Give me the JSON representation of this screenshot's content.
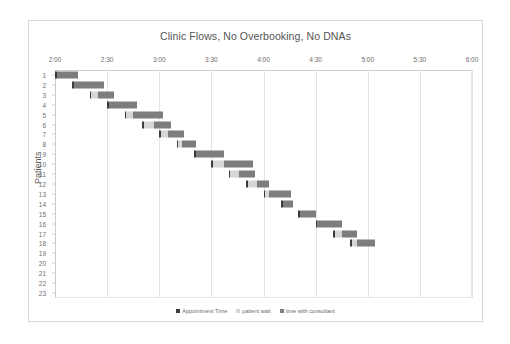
{
  "chart_data": {
    "type": "bar",
    "subtype": "stacked-horizontal-gantt",
    "title": "Clinic Flows, No Overbooking, No DNAs",
    "xlabel": "",
    "ylabel": "Patients",
    "xlim": [
      120,
      360
    ],
    "xtick_labels": [
      "2:00",
      "2:30",
      "3:00",
      "3:30",
      "4:00",
      "4:30",
      "5:00",
      "5:30",
      "6:00"
    ],
    "xtick_values": [
      120,
      150,
      180,
      210,
      240,
      270,
      300,
      330,
      360
    ],
    "categories": [
      "1",
      "2",
      "3",
      "4",
      "5",
      "6",
      "7",
      "8",
      "9",
      "10",
      "11",
      "12",
      "13",
      "14",
      "15",
      "16",
      "17",
      "18",
      "19",
      "20",
      "21",
      "22",
      "23"
    ],
    "ylim": [
      1,
      23
    ],
    "grid": "vertical",
    "legend_position": "bottom",
    "series": [
      {
        "name": "Appointment Time",
        "color": "#3b3b3b",
        "values": [
          120,
          130,
          140,
          150,
          160,
          170,
          180,
          190,
          200,
          210,
          220,
          230,
          240,
          250,
          260,
          270,
          280,
          290,
          null,
          null,
          null,
          null,
          null
        ]
      },
      {
        "name": "patient wait",
        "color": "#d6d6d6",
        "values": [
          0,
          0,
          4,
          0,
          4,
          6,
          4,
          2,
          0,
          6,
          5,
          5,
          2,
          0,
          0,
          0,
          4,
          3,
          null,
          null,
          null,
          null,
          null
        ]
      },
      {
        "name": "time with consultant",
        "color": "#7d7d7d",
        "values": [
          12,
          17,
          9,
          16,
          17,
          10,
          9,
          8,
          16,
          17,
          9,
          7,
          13,
          6,
          9,
          14,
          9,
          10,
          null,
          null,
          null,
          null,
          null
        ]
      }
    ],
    "bars": [
      {
        "patient": "1",
        "appointment_start": 120,
        "wait": 0,
        "consult": 12
      },
      {
        "patient": "2",
        "appointment_start": 130,
        "wait": 0,
        "consult": 17
      },
      {
        "patient": "3",
        "appointment_start": 140,
        "wait": 4,
        "consult": 9
      },
      {
        "patient": "4",
        "appointment_start": 150,
        "wait": 0,
        "consult": 16
      },
      {
        "patient": "5",
        "appointment_start": 160,
        "wait": 4,
        "consult": 17
      },
      {
        "patient": "6",
        "appointment_start": 170,
        "wait": 6,
        "consult": 10
      },
      {
        "patient": "7",
        "appointment_start": 180,
        "wait": 4,
        "consult": 9
      },
      {
        "patient": "8",
        "appointment_start": 190,
        "wait": 2,
        "consult": 8
      },
      {
        "patient": "9",
        "appointment_start": 200,
        "wait": 0,
        "consult": 16
      },
      {
        "patient": "10",
        "appointment_start": 210,
        "wait": 6,
        "consult": 17
      },
      {
        "patient": "11",
        "appointment_start": 220,
        "wait": 5,
        "consult": 9
      },
      {
        "patient": "12",
        "appointment_start": 230,
        "wait": 5,
        "consult": 7
      },
      {
        "patient": "13",
        "appointment_start": 240,
        "wait": 2,
        "consult": 13
      },
      {
        "patient": "14",
        "appointment_start": 250,
        "wait": 0,
        "consult": 6
      },
      {
        "patient": "15",
        "appointment_start": 260,
        "wait": 0,
        "consult": 9
      },
      {
        "patient": "16",
        "appointment_start": 270,
        "wait": 0,
        "consult": 14
      },
      {
        "patient": "17",
        "appointment_start": 280,
        "wait": 4,
        "consult": 9
      },
      {
        "patient": "18",
        "appointment_start": 290,
        "wait": 3,
        "consult": 10
      },
      {
        "patient": "19",
        "appointment_start": null,
        "wait": null,
        "consult": null
      },
      {
        "patient": "20",
        "appointment_start": null,
        "wait": null,
        "consult": null
      },
      {
        "patient": "21",
        "appointment_start": null,
        "wait": null,
        "consult": null
      },
      {
        "patient": "22",
        "appointment_start": null,
        "wait": null,
        "consult": null
      },
      {
        "patient": "23",
        "appointment_start": null,
        "wait": null,
        "consult": null
      }
    ],
    "legend": [
      {
        "label": "Appointment Time",
        "color": "#3b3b3b"
      },
      {
        "label": "patient wait",
        "color": "#d6d6d6"
      },
      {
        "label": "time with consultant",
        "color": "#7d7d7d"
      }
    ]
  }
}
